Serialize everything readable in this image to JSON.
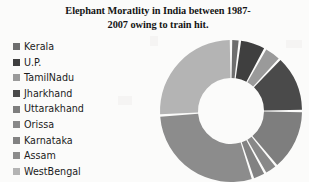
{
  "title": {
    "line1": "Elephant Moratlity in India between 1987-",
    "line2": "2007 owing to train hit.",
    "full": "Elephant Moratlity in India between 1987-2007 owing to train hit."
  },
  "legend": {
    "position": "left",
    "items": [
      {
        "label": "Kerala",
        "color": "#6e6e6e"
      },
      {
        "label": "U.P.",
        "color": "#3f3f3f"
      },
      {
        "label": "TamilNadu",
        "color": "#9a9a9a"
      },
      {
        "label": "Jharkhand",
        "color": "#4a4a4a"
      },
      {
        "label": "Uttarakhand",
        "color": "#7e7e7e"
      },
      {
        "label": "Orissa",
        "color": "#888888"
      },
      {
        "label": "Karnataka",
        "color": "#828282"
      },
      {
        "label": "Assam",
        "color": "#8c8c8c"
      },
      {
        "label": "WestBengal",
        "color": "#b4b4b4"
      }
    ]
  },
  "chart_data": {
    "type": "pie",
    "variant": "doughnut",
    "xlabel": "",
    "ylabel": "",
    "legend_position": "left",
    "grid": false,
    "start_angle_deg": 0,
    "direction": "clockwise",
    "hole_ratio": 0.47,
    "categories": [
      "Kerala",
      "U.P.",
      "TamilNadu",
      "Jharkhand",
      "Uttarakhand",
      "Orissa",
      "Karnataka",
      "Assam",
      "WestBengal"
    ],
    "values": [
      2,
      6,
      4,
      13,
      14,
      3,
      3,
      29,
      26
    ],
    "percentages": [
      2,
      6,
      4,
      13,
      14,
      3,
      3,
      29,
      26
    ],
    "colors": [
      "#6e6e6e",
      "#3f3f3f",
      "#9a9a9a",
      "#4a4a4a",
      "#7e7e7e",
      "#888888",
      "#828282",
      "#8c8c8c",
      "#b4b4b4"
    ],
    "slice_angles_deg": [
      7.2,
      21.6,
      14.4,
      46.8,
      50.4,
      10.8,
      10.8,
      104.4,
      93.6
    ],
    "data_labels": false
  },
  "render": {
    "center_x": 76,
    "center_y": 78,
    "outer_radius": 71,
    "inner_radius": 33,
    "gap_deg": 2.0,
    "background": "#fbfbfa"
  }
}
